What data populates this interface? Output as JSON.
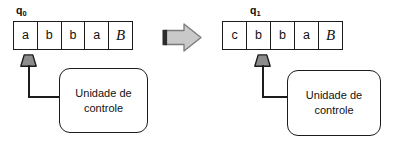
{
  "diagram": {
    "type": "turing-machine-transition",
    "caption": "",
    "before": {
      "state_label": "q",
      "state_subscript": "0",
      "tape": [
        "a",
        "b",
        "b",
        "a",
        "B"
      ],
      "blank_symbol": "B",
      "blank_index": 4,
      "head_index": 0,
      "control_unit": {
        "line1": "Unidade de",
        "line2": "controle"
      }
    },
    "after": {
      "state_label": "q",
      "state_subscript": "1",
      "tape": [
        "c",
        "b",
        "b",
        "a",
        "B"
      ],
      "blank_symbol": "B",
      "blank_index": 4,
      "head_index": 1,
      "control_unit": {
        "line1": "Unidade de",
        "line2": "controle"
      }
    },
    "arrow": {
      "name": "transition-arrow",
      "direction": "right",
      "fill_color": "#c9c9c9",
      "edge_color": "#6b6b6b",
      "bar_color": "#2b2b2b"
    },
    "colors": {
      "stroke": "#1c1c1c",
      "head_fill": "#8c8c8c",
      "background": "#ffffff",
      "text": "#111111"
    }
  }
}
